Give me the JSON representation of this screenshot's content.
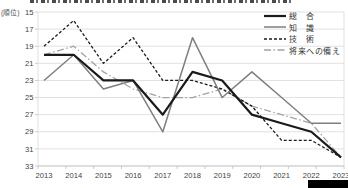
{
  "figure": {
    "note": ""
  },
  "chart_data": {
    "type": "line",
    "title": "",
    "x": [
      "2013",
      "2014",
      "2015",
      "2016",
      "2017",
      "2018",
      "2019",
      "2020",
      "2021",
      "2022",
      "2023"
    ],
    "x_axis": {
      "label": ""
    },
    "y_axis": {
      "unit": "(順位)",
      "ticks": [
        15,
        17,
        19,
        21,
        23,
        25,
        27,
        29,
        31,
        33
      ],
      "range": [
        15,
        33
      ],
      "inverted": true
    },
    "grid": "horizontal",
    "legend_position": "top-right",
    "series": [
      {
        "key": "overall",
        "name": "総　合",
        "color": "#1a1a1a",
        "style": "solid",
        "width": 2.2,
        "values": [
          20,
          20,
          23,
          23,
          27,
          22,
          23,
          27,
          28,
          29,
          32
        ]
      },
      {
        "key": "knowledge",
        "name": "知　識",
        "color": "#7f7f7f",
        "style": "solid",
        "width": 1.5,
        "values": [
          23,
          20,
          24,
          23,
          29,
          18,
          25,
          22,
          25,
          28,
          28
        ]
      },
      {
        "key": "technology",
        "name": "技　術",
        "color": "#1a1a1a",
        "style": "dashed",
        "width": 1.3,
        "values": [
          19,
          16,
          21,
          18,
          23,
          23,
          24,
          26,
          30,
          30,
          32
        ]
      },
      {
        "key": "future-readiness",
        "name": "将来への備え",
        "color": "#a3a3a3",
        "style": "dashdot",
        "width": 1.3,
        "values": [
          20,
          19,
          22,
          24,
          25,
          25,
          24,
          26,
          27,
          28,
          32
        ]
      }
    ]
  }
}
